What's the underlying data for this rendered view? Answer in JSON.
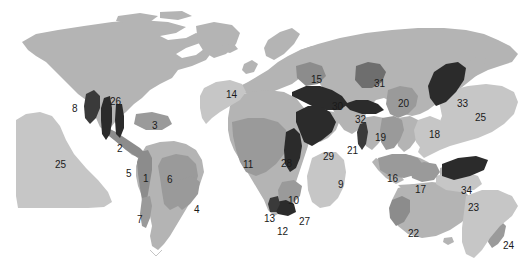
{
  "figure": {
    "name": "world-biodiversity-hotspot-map",
    "background_color": "#ffffff",
    "width": 529,
    "height": 273
  },
  "colors": {
    "land_base": "#b4b4b4",
    "land_light": "#c6c6c6",
    "region_mid": "#9a9a9a",
    "region_dark": "#3a3a3a",
    "region_darker": "#2b2b2b",
    "ocean": "#ffffff",
    "label_text": "#1a1a1a"
  },
  "legend_note": "",
  "regions": [
    {
      "id": "1",
      "label": "1",
      "x": 143,
      "y": 174
    },
    {
      "id": "2",
      "label": "2",
      "x": 117,
      "y": 144
    },
    {
      "id": "3",
      "label": "3",
      "x": 152,
      "y": 121
    },
    {
      "id": "4",
      "label": "4",
      "x": 194,
      "y": 205
    },
    {
      "id": "5",
      "label": "5",
      "x": 126,
      "y": 169
    },
    {
      "id": "6",
      "label": "6",
      "x": 167,
      "y": 175
    },
    {
      "id": "7",
      "label": "7",
      "x": 137,
      "y": 215
    },
    {
      "id": "8",
      "label": "8",
      "x": 72,
      "y": 104
    },
    {
      "id": "9",
      "label": "9",
      "x": 338,
      "y": 180
    },
    {
      "id": "10",
      "label": "10",
      "x": 288,
      "y": 196
    },
    {
      "id": "11",
      "label": "11",
      "x": 243,
      "y": 160
    },
    {
      "id": "12",
      "label": "12",
      "x": 277,
      "y": 227
    },
    {
      "id": "13",
      "label": "13",
      "x": 264,
      "y": 214
    },
    {
      "id": "14",
      "label": "14",
      "x": 226,
      "y": 90
    },
    {
      "id": "15",
      "label": "15",
      "x": 311,
      "y": 75
    },
    {
      "id": "16",
      "label": "16",
      "x": 387,
      "y": 174
    },
    {
      "id": "17",
      "label": "17",
      "x": 415,
      "y": 185
    },
    {
      "id": "18",
      "label": "18",
      "x": 429,
      "y": 130
    },
    {
      "id": "19",
      "label": "19",
      "x": 375,
      "y": 133
    },
    {
      "id": "20",
      "label": "20",
      "x": 398,
      "y": 99
    },
    {
      "id": "21",
      "label": "21",
      "x": 347,
      "y": 146
    },
    {
      "id": "22",
      "label": "22",
      "x": 408,
      "y": 229
    },
    {
      "id": "23",
      "label": "23",
      "x": 468,
      "y": 203
    },
    {
      "id": "24",
      "label": "24",
      "x": 503,
      "y": 241
    },
    {
      "id": "25",
      "label": "25",
      "x": 55,
      "y": 160
    },
    {
      "id": "25b",
      "label": "25",
      "x": 475,
      "y": 113
    },
    {
      "id": "26",
      "label": "26",
      "x": 110,
      "y": 97
    },
    {
      "id": "27",
      "label": "27",
      "x": 299,
      "y": 217
    },
    {
      "id": "28",
      "label": "28",
      "x": 281,
      "y": 159
    },
    {
      "id": "29",
      "label": "29",
      "x": 323,
      "y": 152
    },
    {
      "id": "30",
      "label": "30",
      "x": 332,
      "y": 102
    },
    {
      "id": "31",
      "label": "31",
      "x": 374,
      "y": 79
    },
    {
      "id": "32",
      "label": "32",
      "x": 355,
      "y": 115
    },
    {
      "id": "33",
      "label": "33",
      "x": 457,
      "y": 99
    },
    {
      "id": "34",
      "label": "34",
      "x": 461,
      "y": 186
    }
  ]
}
